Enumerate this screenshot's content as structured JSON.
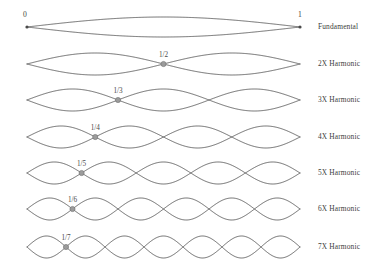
{
  "figure": {
    "stroke_color": "#5c5c5c",
    "node_color": "#9b9b9b",
    "text_color": "#3d3d3d",
    "background": "#ffffff"
  },
  "axis": {
    "start_label": "0",
    "end_label": "1",
    "x_start": 27,
    "x_end": 300
  },
  "chart_data": {
    "type": "line",
    "xlabel": "",
    "ylabel": "",
    "x_domain": [
      0,
      1
    ],
    "y_domain": [
      -1,
      1
    ],
    "grid": false,
    "legend_position": "right",
    "series": [
      {
        "name": "Fundamental",
        "harmonic": 1,
        "lobes": 1,
        "node_fraction": null,
        "node_label": null,
        "amplitude": 1.0
      },
      {
        "name": "2X Harmonic",
        "harmonic": 2,
        "lobes": 2,
        "node_fraction": 0.5,
        "node_label": "1/2",
        "amplitude": 1.0
      },
      {
        "name": "3X Harmonic",
        "harmonic": 3,
        "lobes": 3,
        "node_fraction": 0.3333,
        "node_label": "1/3",
        "amplitude": 1.0
      },
      {
        "name": "4X Harmonic",
        "harmonic": 4,
        "lobes": 4,
        "node_fraction": 0.25,
        "node_label": "1/4",
        "amplitude": 1.0
      },
      {
        "name": "5X Harmonic",
        "harmonic": 5,
        "lobes": 5,
        "node_fraction": 0.2,
        "node_label": "1/5",
        "amplitude": 1.0
      },
      {
        "name": "6X Harmonic",
        "harmonic": 6,
        "lobes": 6,
        "node_fraction": 0.1667,
        "node_label": "1/6",
        "amplitude": 1.0
      },
      {
        "name": "7X Harmonic",
        "harmonic": 7,
        "lobes": 7,
        "node_fraction": 0.1429,
        "node_label": "1/7",
        "amplitude": 1.0
      }
    ]
  },
  "rows": [
    {
      "label": "Fundamental",
      "harmonic": 1,
      "node_label": null,
      "center_y": 27,
      "amplitude": 10,
      "label_x": 318,
      "label_y": 23
    },
    {
      "label": "2X Harmonic",
      "harmonic": 2,
      "node_label": "1/2",
      "center_y": 64,
      "amplitude": 11,
      "label_x": 318,
      "label_y": 60
    },
    {
      "label": "3X Harmonic",
      "harmonic": 3,
      "node_label": "1/3",
      "center_y": 100,
      "amplitude": 11,
      "label_x": 318,
      "label_y": 96
    },
    {
      "label": "4X Harmonic",
      "harmonic": 4,
      "node_label": "1/4",
      "center_y": 137,
      "amplitude": 11,
      "label_x": 318,
      "label_y": 133
    },
    {
      "label": "5X Harmonic",
      "harmonic": 5,
      "node_label": "1/5",
      "center_y": 173,
      "amplitude": 11,
      "label_x": 318,
      "label_y": 169
    },
    {
      "label": "6X Harmonic",
      "harmonic": 6,
      "node_label": "1/6",
      "center_y": 209,
      "amplitude": 11,
      "label_x": 318,
      "label_y": 205
    },
    {
      "label": "7X Harmonic",
      "harmonic": 7,
      "node_label": "1/7",
      "center_y": 247,
      "amplitude": 11,
      "label_x": 318,
      "label_y": 243
    }
  ]
}
